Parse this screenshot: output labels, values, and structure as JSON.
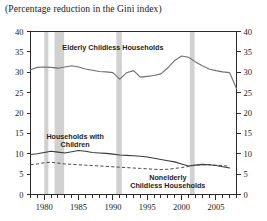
{
  "figure": {
    "title": "(Percentage reduction in the Gini index)"
  },
  "chart_data": {
    "type": "line",
    "title": "(Percentage reduction in the Gini index)",
    "xlabel": "",
    "ylabel": "",
    "xlim": [
      1978,
      2008
    ],
    "ylim": [
      0,
      40
    ],
    "ytick_step": 5,
    "xtick_step": 1,
    "grid": false,
    "legend": "inline-annotations",
    "dual_y_axis": true,
    "y_ticks": [
      0,
      5,
      10,
      15,
      20,
      25,
      30,
      35,
      40
    ],
    "y_tick_labels": [
      "0",
      "5",
      "10",
      "15",
      "20",
      "25",
      "30",
      "35",
      "40"
    ],
    "x_ticks": [
      1978,
      1979,
      1980,
      1981,
      1982,
      1983,
      1984,
      1985,
      1986,
      1987,
      1988,
      1989,
      1990,
      1991,
      1992,
      1993,
      1994,
      1995,
      1996,
      1997,
      1998,
      1999,
      2000,
      2001,
      2002,
      2003,
      2004,
      2005,
      2006,
      2007,
      2008
    ],
    "x_tick_labels": [
      {
        "year": 1980,
        "label": "1980"
      },
      {
        "year": 1985,
        "label": "1985"
      },
      {
        "year": 1990,
        "label": "1990"
      },
      {
        "year": 1995,
        "label": "1995"
      },
      {
        "year": 2000,
        "label": "2000"
      },
      {
        "year": 2005,
        "label": "2005"
      }
    ],
    "recession_bands": [
      {
        "start": 1980.0,
        "end": 1980.6
      },
      {
        "start": 1981.5,
        "end": 1982.9
      },
      {
        "start": 1990.5,
        "end": 1991.3
      },
      {
        "start": 2001.2,
        "end": 2001.9
      }
    ],
    "x": [
      1978,
      1979,
      1980,
      1981,
      1982,
      1983,
      1984,
      1985,
      1986,
      1987,
      1988,
      1989,
      1990,
      1991,
      1992,
      1993,
      1994,
      1995,
      1996,
      1997,
      1998,
      1999,
      2000,
      2001,
      2002,
      2003,
      2004,
      2005,
      2006,
      2007
    ],
    "series": [
      {
        "name": "Elderly Childless Households",
        "style": "solid",
        "color": "#6f6f6f",
        "label_x": 1990.0,
        "label_y": 35.5,
        "values": [
          30.6,
          31.2,
          31.3,
          31.2,
          31.0,
          31.3,
          31.6,
          31.3,
          30.8,
          30.5,
          30.2,
          30.1,
          29.9,
          28.3,
          29.9,
          30.4,
          28.8,
          29.0,
          29.2,
          29.6,
          31.1,
          32.9,
          34.0,
          33.7,
          32.6,
          31.6,
          30.8,
          30.4,
          30.1,
          29.9
        ],
        "values_detail_note": "peaks near 34 around 2000, dips to ~26 at end",
        "tail": {
          "2008": 26.0
        }
      },
      {
        "name": "Households with Children",
        "style": "solid-dark",
        "color": "#3a3a3a",
        "label_x": 1984.5,
        "label_y": 13.6,
        "label_lines": [
          "Households with",
          "Children"
        ],
        "values": [
          9.8,
          10.0,
          10.3,
          10.6,
          10.4,
          10.2,
          10.5,
          10.8,
          10.6,
          10.3,
          10.2,
          10.1,
          9.9,
          9.7,
          9.6,
          9.5,
          9.4,
          9.2,
          8.9,
          8.6,
          8.3,
          8.0,
          7.5,
          7.0,
          7.2,
          7.4,
          7.3,
          7.1,
          6.8,
          6.5
        ]
      },
      {
        "name": "Nonelderly Childless Households",
        "style": "dashed",
        "color": "#4a4a4a",
        "label_x": 1998.0,
        "label_y": 3.6,
        "label_lines": [
          "Nonelderly",
          "Childless Households"
        ],
        "values": [
          7.3,
          7.5,
          7.8,
          7.9,
          7.7,
          7.5,
          7.4,
          7.3,
          7.2,
          7.1,
          7.0,
          6.9,
          6.8,
          6.7,
          6.6,
          6.5,
          6.4,
          6.3,
          6.2,
          6.1,
          6.2,
          6.4,
          6.6,
          6.9,
          7.2,
          7.3,
          7.3,
          7.2,
          7.1,
          6.9
        ]
      }
    ]
  }
}
